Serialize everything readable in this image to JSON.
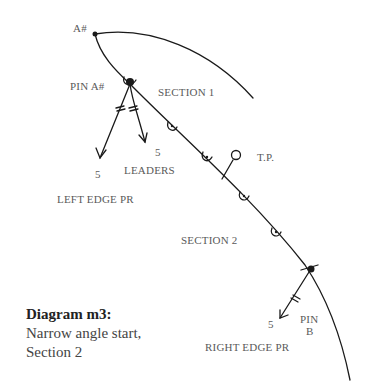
{
  "diagram": {
    "labels": {
      "point_a": "A#",
      "pin_a": "PIN A#",
      "section_1": "SECTION 1",
      "leaders_count": "5",
      "leaders": "LEADERS",
      "left_count": "5",
      "left_edge": "LEFT EDGE PR",
      "tp": "T.P.",
      "section_2": "SECTION 2",
      "right_count": "5",
      "pin_b_line1": "PIN",
      "pin_b_line2": "B",
      "right_edge": "RIGHT EDGE PR"
    },
    "caption": {
      "title": "Diagram m3:",
      "line1": "Narrow angle start,",
      "line2": "Section 2"
    },
    "colors": {
      "stroke": "#1a1a1a",
      "label": "#5a5a5a"
    }
  }
}
